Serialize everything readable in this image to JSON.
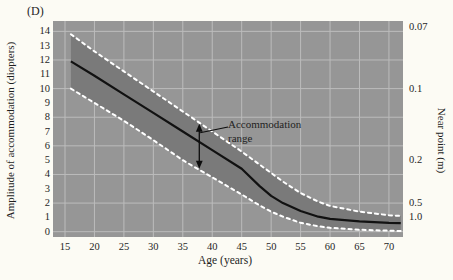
{
  "figure": {
    "panel_label": "(D)",
    "colors": {
      "page_bg": "#fcfbf4",
      "plot_bg": "#969696",
      "band_fill": "#7a7a7a",
      "gridline": "#bcbcbc",
      "mean_line": "#111111",
      "band_edge_dashed": "#ffffff",
      "text": "#1f1f1f",
      "arrow": "#0d0d0d"
    }
  },
  "chart_data": {
    "type": "line",
    "title": "",
    "xlabel": "Age (years)",
    "ylabel_left": "Amplitude of accommodation (diopters)",
    "ylabel_right": "Near point (m)",
    "x_axis": {
      "min": 13.1,
      "max": 72.4,
      "ticks": [
        15,
        20,
        25,
        30,
        35,
        40,
        45,
        50,
        55,
        60,
        65,
        70
      ]
    },
    "y_axis_left": {
      "min": 0,
      "max": 14.7,
      "ticks": [
        0,
        1,
        2,
        3,
        4,
        5,
        6,
        7,
        8,
        9,
        10,
        11,
        12,
        13,
        14
      ],
      "gridlines_at": [
        0,
        2,
        4,
        6,
        8,
        10,
        12,
        14
      ]
    },
    "y_axis_right": {
      "note": "near point in meters = 1 / diopters; labels sit at diopter position 1/value",
      "ticks": [
        {
          "label": "0.07",
          "value": 0.07
        },
        {
          "label": "0.1",
          "value": 0.1
        },
        {
          "label": "0.2",
          "value": 0.2
        },
        {
          "label": "0.5",
          "value": 0.5
        },
        {
          "label": "1.0",
          "value": 1.0
        }
      ]
    },
    "grid": true,
    "legend": false,
    "x": [
      16,
      20,
      25,
      30,
      35,
      40,
      45,
      48,
      50,
      52,
      55,
      58,
      60,
      65,
      70,
      72
    ],
    "series": [
      {
        "name": "upper-limit",
        "style": "dashed-white",
        "values": [
          13.8,
          12.6,
          11.2,
          9.8,
          8.4,
          7.0,
          5.6,
          4.7,
          4.1,
          3.5,
          2.7,
          2.1,
          1.8,
          1.4,
          1.15,
          1.1
        ]
      },
      {
        "name": "mean",
        "style": "solid-black",
        "values": [
          11.9,
          10.9,
          9.6,
          8.3,
          7.0,
          5.7,
          4.4,
          3.2,
          2.5,
          2.0,
          1.45,
          1.05,
          0.9,
          0.72,
          0.62,
          0.6
        ]
      },
      {
        "name": "lower-limit",
        "style": "dashed-white",
        "values": [
          10.0,
          9.0,
          7.75,
          6.4,
          5.0,
          3.8,
          2.6,
          1.85,
          1.4,
          1.05,
          0.62,
          0.38,
          0.27,
          0.14,
          0.07,
          0.05
        ]
      }
    ],
    "annotation": {
      "line1": "Accommodation",
      "line2": "range",
      "arrow_age": 37.8
    }
  }
}
